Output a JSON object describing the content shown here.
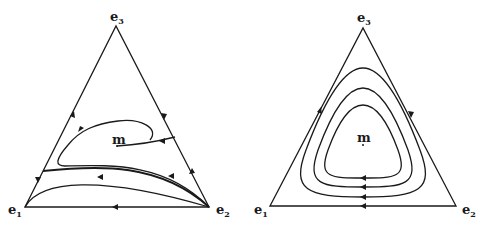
{
  "figure": {
    "panels": [
      {
        "id": "left",
        "vertices": {
          "e1": "e",
          "e2": "e",
          "e3": "e"
        },
        "labels": {
          "e1": {
            "base": "e",
            "sub": "1"
          },
          "e2": {
            "base": "e",
            "sub": "2"
          },
          "e3": {
            "base": "e",
            "sub": "3"
          },
          "center": "m"
        },
        "description": "Simplex phase portrait: orbits spiral toward heteroclinic cycle near boundary; interior point m"
      },
      {
        "id": "right",
        "labels": {
          "e1": {
            "base": "e",
            "sub": "1"
          },
          "e2": {
            "base": "e",
            "sub": "2"
          },
          "e3": {
            "base": "e",
            "sub": "3"
          },
          "center": "m"
        },
        "description": "Simplex phase portrait: closed periodic orbits surrounding interior equilibrium m"
      }
    ],
    "stroke_color": "#1a1a1a",
    "background": "#ffffff"
  }
}
